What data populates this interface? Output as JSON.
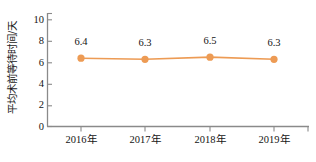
{
  "chart_data": {
    "type": "line",
    "title": "",
    "xlabel": "",
    "ylabel": "平均术前等待时间/天",
    "categories": [
      "2016年",
      "2017年",
      "2018年",
      "2019年"
    ],
    "values": [
      6.4,
      6.3,
      6.5,
      6.3
    ],
    "point_labels": [
      "6.4",
      "6.3",
      "6.5",
      "6.3"
    ],
    "series": [
      {
        "name": "平均术前等待时间",
        "values": [
          6.4,
          6.3,
          6.5,
          6.3
        ],
        "color": "#ED9B54",
        "marker": "circle",
        "marker_color": "#ED9B54"
      }
    ],
    "ylim": [
      0,
      10
    ],
    "ytick_labels": [
      "0",
      "2",
      "4",
      "6",
      "8",
      "10"
    ],
    "ytick_values": [
      0,
      2,
      4,
      6,
      8,
      10
    ],
    "grid": false,
    "legend": false,
    "legend_position": "none",
    "axis_color": "#808080",
    "accent_color": "#ED9B54"
  },
  "axis": {
    "y_title": "平均术前等待时间/天",
    "y_ticks": [
      "0",
      "2",
      "4",
      "6",
      "8",
      "10"
    ],
    "x_ticks": [
      "2016年",
      "2017年",
      "2018年",
      "2019年"
    ]
  },
  "labels": {
    "p0": "6.4",
    "p1": "6.3",
    "p2": "6.5",
    "p3": "6.3"
  }
}
